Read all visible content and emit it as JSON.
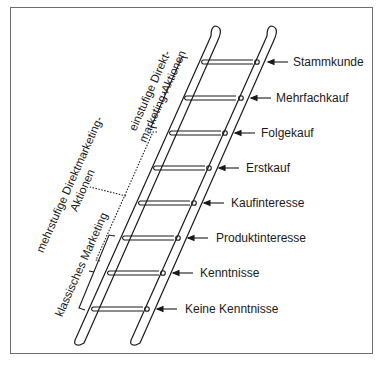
{
  "diagram": {
    "type": "ladder",
    "steps": [
      {
        "label": "Stammkunde"
      },
      {
        "label": "Mehrfachkauf"
      },
      {
        "label": "Folgekauf"
      },
      {
        "label": "Erstkauf"
      },
      {
        "label": "Kaufinteresse"
      },
      {
        "label": "Produktinteresse"
      },
      {
        "label": "Kenntnisse"
      },
      {
        "label": "Keine Kenntnisse"
      }
    ],
    "brackets": {
      "einstufig": {
        "line1": "einstufige Direkt-",
        "line2": "marketing-Aktionen"
      },
      "mehrstufig": {
        "line1": "mehrstufige Direktmarketing-",
        "line2": "Aktionen"
      },
      "klassisch": {
        "line1": "klassisches Marketing"
      }
    },
    "colors": {
      "stroke": "#1a1a1a",
      "frame": "#6e6e6e",
      "background": "#ffffff"
    }
  }
}
